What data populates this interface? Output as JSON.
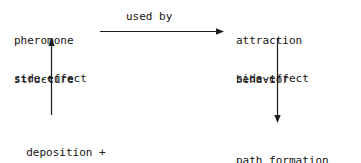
{
  "diagram": {
    "background_color": "#ffffff",
    "stroke_color": "#1d1d1d",
    "text_color": "#141414",
    "nodes": [
      {
        "id": "pheromone-structure",
        "line1": "pheromone",
        "line2": "structure"
      },
      {
        "id": "attraction-behavior",
        "line1": "attraction",
        "line2": "behavior"
      },
      {
        "id": "deposition-dissipation-food",
        "line1": "deposition +",
        "line2": "dissipation +",
        "line3": "food"
      },
      {
        "id": "path-formation",
        "line1": "path formation"
      }
    ],
    "edges": [
      {
        "id": "pheromone-to-attraction",
        "label": "used by",
        "direction": "right",
        "from": "pheromone-structure",
        "to": "attraction-behavior"
      },
      {
        "id": "sources-to-pheromone",
        "label": "side-effect",
        "direction": "up",
        "from": "deposition-dissipation-food",
        "to": "pheromone-structure"
      },
      {
        "id": "attraction-to-path",
        "label": "side-effect",
        "direction": "down",
        "from": "attraction-behavior",
        "to": "path-formation"
      }
    ]
  }
}
